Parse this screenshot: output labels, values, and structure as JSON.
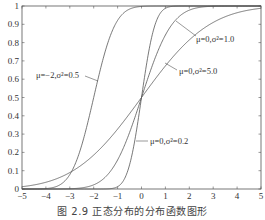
{
  "caption": "图 2.9   正态分布的分布函数图形",
  "chart_data": {
    "type": "line",
    "title": "",
    "caption": "图 2.9   正态分布的分布函数图形",
    "xlabel": "",
    "ylabel": "",
    "xlim": [
      -5,
      5
    ],
    "ylim": [
      0,
      1
    ],
    "grid": false,
    "legend": "inline annotations with leader lines",
    "x_ticks": [
      -5,
      -4,
      -3,
      -2,
      -1,
      0,
      1,
      2,
      3,
      4,
      5
    ],
    "x_tick_labels": [
      "−5",
      "−4",
      "−3",
      "−2",
      "−1",
      "0",
      "1",
      "2",
      "3",
      "4",
      "5"
    ],
    "y_ticks": [
      0,
      0.1,
      0.2,
      0.3,
      0.4,
      0.5,
      0.6,
      0.7,
      0.8,
      0.9,
      1
    ],
    "y_tick_labels": [
      "0",
      "0.1",
      "0.2",
      "0.3",
      "0.4",
      "0.5",
      "0.6",
      "0.7",
      "0.8",
      "0.9",
      "1"
    ],
    "series": [
      {
        "name": "μ=0,σ²=0.2",
        "mu": 0,
        "variance": 0.2,
        "x": [
          -5,
          -4,
          -3,
          -2,
          -1.5,
          -1,
          -0.5,
          0,
          0.5,
          1,
          1.5,
          2,
          3,
          4,
          5
        ],
        "values": [
          0,
          0,
          0,
          0,
          0.0004,
          0.0127,
          0.1318,
          0.5,
          0.8682,
          0.9873,
          0.9996,
          1,
          1,
          1,
          1
        ],
        "label": "μ=0,σ²=0.2",
        "label_pos": [
          150,
          144
        ],
        "leader": [
          [
            136,
            141
          ],
          [
            148,
            141
          ]
        ]
      },
      {
        "name": "μ=0,σ²=1.0",
        "mu": 0,
        "variance": 1.0,
        "x": [
          -5,
          -4,
          -3,
          -2,
          -1,
          0,
          1,
          2,
          3,
          4,
          5
        ],
        "values": [
          0,
          0,
          0.0013,
          0.0228,
          0.1587,
          0.5,
          0.8413,
          0.9772,
          0.9987,
          1,
          1
        ],
        "label": "μ=0,σ²=1.0",
        "label_pos": [
          196,
          42
        ],
        "leader": [
          [
            176,
            21
          ],
          [
            196,
            36
          ]
        ]
      },
      {
        "name": "μ=0,σ²=5.0",
        "mu": 0,
        "variance": 5.0,
        "x": [
          -5,
          -4,
          -3,
          -2,
          -1,
          0,
          1,
          2,
          3,
          4,
          5
        ],
        "values": [
          0.0127,
          0.0368,
          0.0899,
          0.1855,
          0.3274,
          0.5,
          0.6726,
          0.8145,
          0.9101,
          0.9632,
          0.9873
        ],
        "label": "μ=0,σ²=5.0",
        "label_pos": [
          179,
          74
        ],
        "leader": [
          [
            165,
            63
          ],
          [
            177,
            70
          ]
        ]
      },
      {
        "name": "μ=−2,σ²=0.5",
        "mu": -2,
        "variance": 0.5,
        "x": [
          -5,
          -4,
          -3,
          -2.5,
          -2,
          -1.5,
          -1,
          0,
          1,
          2,
          3,
          4,
          5
        ],
        "values": [
          0,
          0.0023,
          0.0786,
          0.2398,
          0.5,
          0.7602,
          0.9214,
          0.9977,
          1,
          1,
          1,
          1,
          1
        ],
        "label": "μ=−2,σ²=0.5",
        "label_pos": [
          36,
          78
        ],
        "leader": [
          [
            85,
            76
          ],
          [
            98,
            81
          ]
        ]
      }
    ]
  },
  "colors": {
    "axis": "#555555",
    "line": "#555555",
    "text": "#333333",
    "background": "#ffffff"
  }
}
